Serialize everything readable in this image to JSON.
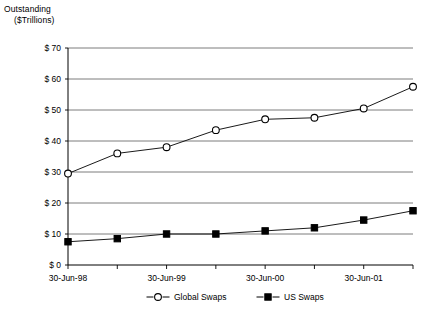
{
  "chart_data": {
    "type": "line",
    "title": "Outstanding ($Trillions)",
    "title_lines": [
      "Outstanding",
      "($Trillions)"
    ],
    "xlabel": "",
    "ylabel": "Outstanding ($Trillions)",
    "ylim": [
      0,
      70
    ],
    "ytick_step": 10,
    "ytick_labels": [
      "$ 70",
      "$ 60",
      "$ 50",
      "$ 40",
      "$ 30",
      "$ 20",
      "$ 10",
      "$  0"
    ],
    "ytick_values": [
      70,
      60,
      50,
      40,
      30,
      20,
      10,
      0
    ],
    "grid": true,
    "grid_axis": "y",
    "legend_position": "bottom",
    "x": [
      0,
      1,
      2,
      3,
      4,
      5,
      6,
      7
    ],
    "xtick_positions": [
      0,
      2,
      4,
      6
    ],
    "categories": [
      "30-Jun-98",
      "31-Dec-98",
      "30-Jun-99",
      "31-Dec-99",
      "30-Jun-00",
      "31-Dec-00",
      "30-Jun-01",
      "31-Dec-01"
    ],
    "xtick_labels": [
      "30-Jun-98",
      "30-Jun-99",
      "30-Jun-00",
      "30-Jun-01"
    ],
    "series": [
      {
        "name": "Global Swaps",
        "marker": "open-circle",
        "color": "#000000",
        "values": [
          29.5,
          36.0,
          38.0,
          43.5,
          47.0,
          47.5,
          50.5,
          57.5
        ]
      },
      {
        "name": "US Swaps",
        "marker": "filled-square",
        "color": "#000000",
        "values": [
          7.5,
          8.5,
          10.0,
          10.0,
          11.0,
          12.0,
          14.5,
          17.5
        ]
      }
    ]
  },
  "legend": {
    "items": [
      {
        "label": "Global Swaps",
        "marker": "open-circle"
      },
      {
        "label": "US Swaps",
        "marker": "filled-square"
      }
    ]
  }
}
